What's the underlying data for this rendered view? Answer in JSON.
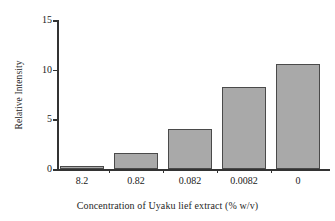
{
  "chart_data": {
    "type": "bar",
    "title": "",
    "xlabel": "Concentration of Uyaku lief extract (% w/v)",
    "ylabel": "Relative Intensity",
    "categories": [
      "8.2",
      "0.82",
      "0.082",
      "0.0082",
      "0"
    ],
    "values": [
      0.3,
      1.6,
      4.0,
      8.3,
      10.6
    ],
    "ylim": [
      0,
      15
    ],
    "yticks": [
      0,
      5,
      10,
      15
    ],
    "ytick_labels": [
      "0",
      "5",
      "10",
      "15"
    ],
    "grid": false,
    "legend": "none",
    "bar_fill_color": "#a9a9a9",
    "bar_edge_color": "#4a4a4a",
    "axis_color": "#333333"
  },
  "axes": {
    "y_title": "Relative Intensity",
    "x_title": "Concentration of Uyaku lief extract (% w/v)",
    "y_labels": {
      "t0": "0",
      "t1": "5",
      "t2": "10",
      "t3": "15"
    },
    "x_labels": {
      "c0": "8.2",
      "c1": "0.82",
      "c2": "0.082",
      "c3": "0.0082",
      "c4": "0"
    }
  }
}
